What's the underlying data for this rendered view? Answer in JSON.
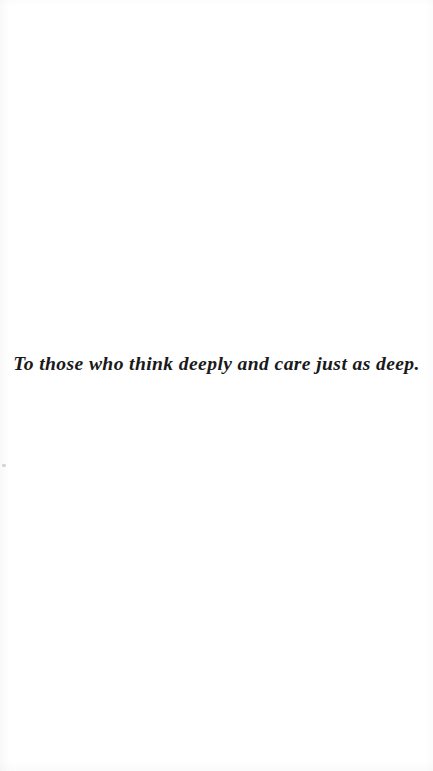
{
  "page": {
    "kind": "book-dedication-page",
    "background_color": "#ffffff",
    "width": 433,
    "height": 771
  },
  "dedication": {
    "text": "To those who think deeply and care just as deep.",
    "color": "#1a1a1a",
    "alignment": "center",
    "style": "bold-italic-serif"
  },
  "artifacts": {
    "speck_label": ""
  }
}
